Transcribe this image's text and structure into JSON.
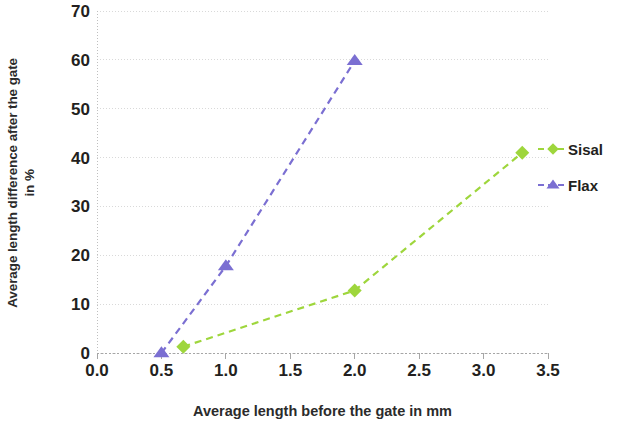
{
  "chart_data": {
    "type": "line",
    "title": "",
    "subtitle": "",
    "xlabel": "Average length before the gate in mm",
    "ylabel": "Average length difference after the gate in %",
    "ylabel_line1": "Average length difference after the gate",
    "ylabel_line2": "in %",
    "xlim": [
      0.0,
      3.5
    ],
    "ylim": [
      0,
      70
    ],
    "xticks": [
      "0.0",
      "0.5",
      "1.0",
      "1.5",
      "2.0",
      "2.5",
      "3.0",
      "3.5"
    ],
    "xtick_values": [
      0.0,
      0.5,
      1.0,
      1.5,
      2.0,
      2.5,
      3.0,
      3.5
    ],
    "yticks": [
      "0",
      "10",
      "20",
      "30",
      "40",
      "50",
      "60",
      "70"
    ],
    "ytick_values": [
      0,
      10,
      20,
      30,
      40,
      50,
      60,
      70
    ],
    "grid": true,
    "grid_axis": "y",
    "grid_style": "dotted",
    "line_style": "dashed",
    "legend_position": "right",
    "series": [
      {
        "name": "Sisal",
        "color": "#9ed63c",
        "marker": "diamond",
        "x": [
          0.67,
          2.0,
          3.3
        ],
        "y": [
          1.3,
          12.8,
          41.0
        ]
      },
      {
        "name": "Flax",
        "color": "#7b6fd2",
        "marker": "triangle",
        "x": [
          0.5,
          1.0,
          2.0
        ],
        "y": [
          0.0,
          17.8,
          59.8
        ]
      }
    ]
  },
  "legend": {
    "items": [
      {
        "label": "Sisal",
        "color": "#9ed63c",
        "marker": "diamond"
      },
      {
        "label": "Flax",
        "color": "#7b6fd2",
        "marker": "triangle"
      }
    ]
  },
  "colors": {
    "sisal": "#9ed63c",
    "flax": "#7b6fd2",
    "axis": "#bfbfbf",
    "grid": "#d9d9d9",
    "text": "#231f20",
    "background": "#ffffff"
  }
}
